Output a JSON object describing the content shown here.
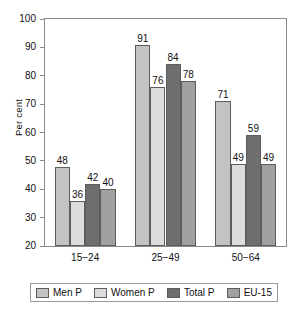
{
  "chart_data": {
    "type": "bar",
    "title": "",
    "subtitle": "",
    "xlabel": "",
    "ylabel": "Per cent",
    "ylim": [
      20,
      100
    ],
    "ytick_step": 10,
    "yticks": [
      100,
      90,
      80,
      70,
      60,
      50,
      40,
      30,
      20
    ],
    "grid": false,
    "legend_position": "bottom",
    "categories": [
      "15−24",
      "25−49",
      "50−64"
    ],
    "series": [
      {
        "name": "Men P",
        "color": "#c3c3c3",
        "values": [
          48,
          91,
          71
        ]
      },
      {
        "name": "Women P",
        "color": "#dcdcdc",
        "values": [
          36,
          76,
          49
        ]
      },
      {
        "name": "Total P",
        "color": "#6e6e6e",
        "values": [
          42,
          84,
          59
        ]
      },
      {
        "name": "EU-15",
        "color": "#a0a0a0",
        "values": [
          40,
          78,
          49
        ]
      }
    ],
    "data_labels": [
      [
        48,
        36,
        42,
        40
      ],
      [
        91,
        76,
        84,
        78
      ],
      [
        71,
        49,
        59,
        49
      ]
    ],
    "axis_color": "#8a8a8a",
    "bar_edge_color": "#5d5d5d",
    "background_color": "#ffffff"
  }
}
